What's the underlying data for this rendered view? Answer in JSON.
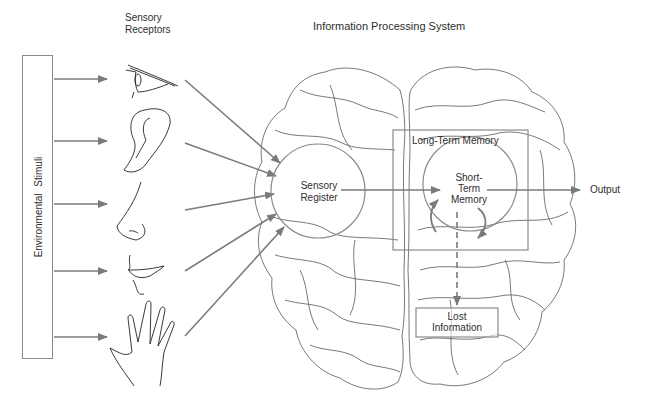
{
  "title": "Information Processing System",
  "column_heading": {
    "line1": "Sensory",
    "line2": "Receptors"
  },
  "input_box": {
    "label": "Environmental  Stimuli"
  },
  "sensory_receptors": [
    {
      "name": "eye",
      "icon": "eye-icon"
    },
    {
      "name": "ear",
      "icon": "ear-icon"
    },
    {
      "name": "nose",
      "icon": "nose-icon"
    },
    {
      "name": "mouth",
      "icon": "mouth-icon"
    },
    {
      "name": "hand",
      "icon": "hand-icon"
    }
  ],
  "nodes": {
    "sensory_register": {
      "line1": "Sensory",
      "line2": "Register"
    },
    "long_term_memory": {
      "label": "Long-Term Memory"
    },
    "short_term_memory": {
      "line1": "Short-",
      "line2": "Term",
      "line3": "Memory"
    },
    "lost_information": {
      "line1": "Lost",
      "line2": "Information"
    },
    "output": {
      "label": "Output"
    }
  },
  "colors": {
    "arrow": "#7a7a7a",
    "outline": "#8a8a8a",
    "brain_line": "#555555",
    "text": "#2e2e2e"
  }
}
